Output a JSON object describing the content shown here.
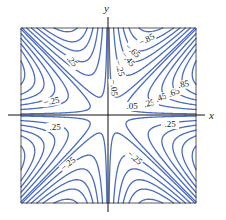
{
  "chart_data": {
    "type": "contour",
    "title": "",
    "function": "f(x,y) = x*y*(x^2 - y^2)/(x^2 + y^2)",
    "xlabel": "x",
    "ylabel": "y",
    "xlim": [
      -2,
      2
    ],
    "ylim": [
      -2,
      2
    ],
    "levels": [
      -0.85,
      -0.65,
      -0.45,
      -0.25,
      -0.05,
      0.05,
      0.25,
      0.45,
      0.65,
      0.85
    ],
    "extra_levels": [
      -1.4,
      -1.1,
      1.1,
      1.4
    ],
    "grid": false,
    "line_color": "#4a6cc2",
    "frame": {
      "left": 21,
      "top": 28,
      "right": 196,
      "bottom": 203
    },
    "axis_origin_px": {
      "x": 108,
      "y": 115
    },
    "contour_labels": [
      {
        "text": "−.85",
        "x": 148,
        "y": 42,
        "rotate": -28
      },
      {
        "text": "−.65",
        "x": 131,
        "y": 53,
        "rotate": 40
      },
      {
        "text": "−.45",
        "x": 126,
        "y": 61,
        "rotate": 50
      },
      {
        "text": "−.25",
        "x": 117,
        "y": 69,
        "rotate": 75
      },
      {
        "text": "−.05",
        "x": 111,
        "y": 88,
        "rotate": 85
      },
      {
        "text": ".05",
        "x": 132,
        "y": 109,
        "rotate": 0
      },
      {
        "text": ".25",
        "x": 150,
        "y": 106,
        "rotate": -15
      },
      {
        "text": ".45",
        "x": 162,
        "y": 100,
        "rotate": -20
      },
      {
        "text": ".65",
        "x": 175,
        "y": 95,
        "rotate": -20
      },
      {
        "text": ".85",
        "x": 184,
        "y": 87,
        "rotate": -10
      },
      {
        "text": ".25",
        "x": 70,
        "y": 63,
        "rotate": 50
      },
      {
        "text": "−.25",
        "x": 52,
        "y": 104,
        "rotate": -10
      },
      {
        "text": ".25",
        "x": 55,
        "y": 130,
        "rotate": 0
      },
      {
        "text": "−.25",
        "x": 70,
        "y": 166,
        "rotate": -40
      },
      {
        "text": ".25",
        "x": 170,
        "y": 127,
        "rotate": 0
      },
      {
        "text": "−.25",
        "x": 133,
        "y": 160,
        "rotate": 40
      }
    ]
  }
}
